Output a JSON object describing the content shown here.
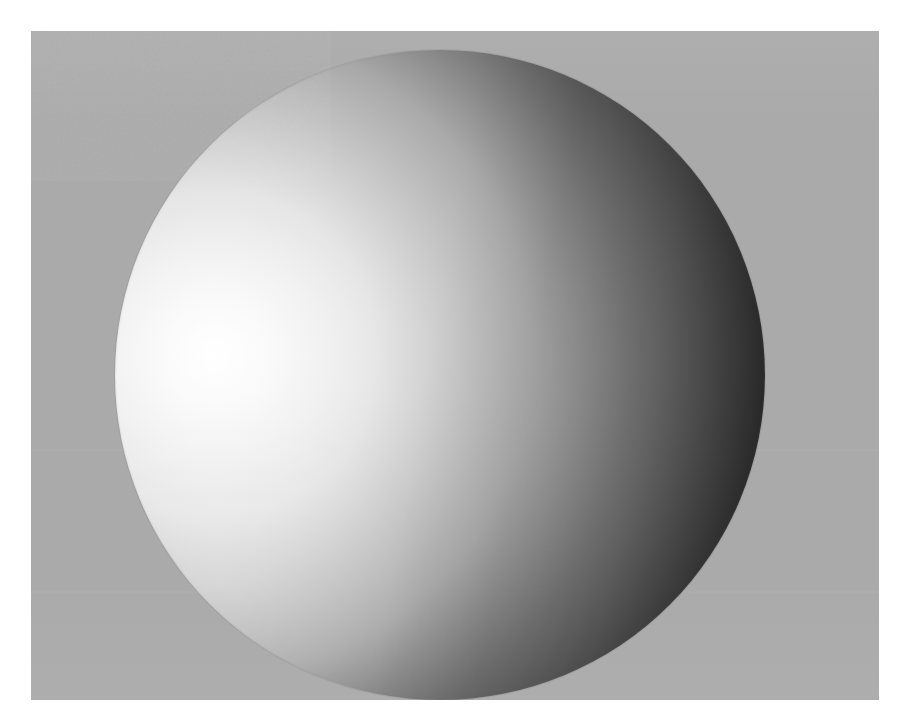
{
  "image": {
    "subject": "shaded-sphere",
    "description": "Grayscale render of a matte sphere lit from the left, photographed against a flat mid-gray backdrop",
    "canvas_width_px": 913,
    "canvas_height_px": 723,
    "margin_color": "#ffffff"
  },
  "backdrop": {
    "name": "gray-backdrop-plane",
    "color": "#aaaaaa",
    "left_px": 31,
    "top_px": 31,
    "width_px": 848,
    "height_px": 669,
    "seams": [
      {
        "label": "upper-seam",
        "y_px": 449
      },
      {
        "label": "lower-seam",
        "y_px": 591
      }
    ]
  },
  "sphere": {
    "name": "shaded-sphere",
    "center_x_px": 440,
    "center_y_px": 375,
    "radius_px": 325,
    "diameter_px": 650,
    "clipped_edges": "top",
    "shading_model": "lambertian-diffuse",
    "light_direction": "upper-left",
    "highlight_x_px": 215,
    "highlight_y_px": 355,
    "highlight_color": "#ffffff",
    "terminator_color": "#6f6f6f",
    "shadow_color": "#1a1a1a",
    "bounce_light": "lower-left limb"
  },
  "tone_stops": [
    {
      "label": "specular-highlight",
      "position_pct": 0,
      "color": "#ffffff"
    },
    {
      "label": "lit-falloff",
      "position_pct": 25,
      "color": "#e6e6e6"
    },
    {
      "label": "midtone",
      "position_pct": 49,
      "color": "#a9a9a9"
    },
    {
      "label": "terminator",
      "position_pct": 64,
      "color": "#6f6f6f"
    },
    {
      "label": "core-shadow",
      "position_pct": 85,
      "color": "#282828"
    },
    {
      "label": "deep-shadow",
      "position_pct": 100,
      "color": "#1a1a1a"
    }
  ],
  "grain": {
    "label": "sensor-noise",
    "opacity": 0.085,
    "blend_mode": "overlay"
  }
}
